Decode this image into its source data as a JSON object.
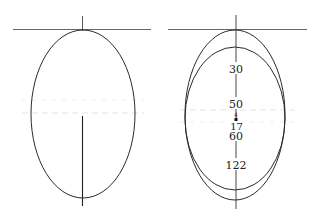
{
  "figures": [
    {
      "id": "left",
      "description": "single ellipse with tangent line at top",
      "colors": {
        "stroke": "#2a2a2a",
        "guide": "#d8d8d8"
      }
    },
    {
      "id": "right",
      "description": "two nested ellipses sharing axis with tangent line at top",
      "labels": {
        "l30": "30",
        "l50": "50",
        "l4": "4",
        "l17": "17",
        "l60": "60",
        "l122": "122"
      }
    }
  ]
}
